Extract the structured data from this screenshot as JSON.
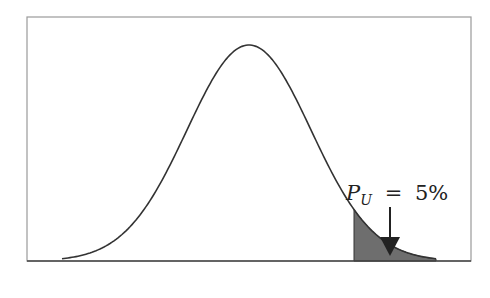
{
  "chart_data": {
    "type": "area",
    "title": "",
    "xlabel": "",
    "ylabel": "",
    "series": [
      {
        "name": "normal density",
        "distribution": "normal",
        "mean_px": 249,
        "peak_px_y": 45
      }
    ],
    "shaded_region": {
      "side": "upper tail",
      "probability": "5%"
    },
    "annotation": {
      "symbol": "P",
      "subscript": "U",
      "equals": "=",
      "value": "5%"
    },
    "grid": false,
    "legend": null
  },
  "annotation": {
    "symbol": "P",
    "subscript": "U",
    "equals": "=",
    "value": "5%"
  },
  "colors": {
    "frame": "#999999",
    "curve": "#333333",
    "shade": "#6e6e6e",
    "axis": "#444444"
  }
}
